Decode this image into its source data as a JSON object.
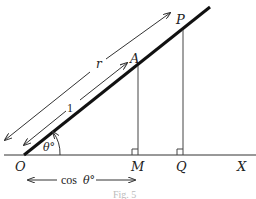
{
  "figure": {
    "caption": "Fig. 5",
    "points": {
      "O": "O",
      "A": "A",
      "P": "P",
      "M": "M",
      "Q": "Q",
      "X": "X"
    },
    "labels": {
      "r": "r",
      "one": "1",
      "theta": "θ°",
      "cos_theta_word": "cos",
      "cos_theta_angle": "θ°"
    },
    "colors": {
      "line": "#222222",
      "caption": "#bbbbbb"
    }
  }
}
